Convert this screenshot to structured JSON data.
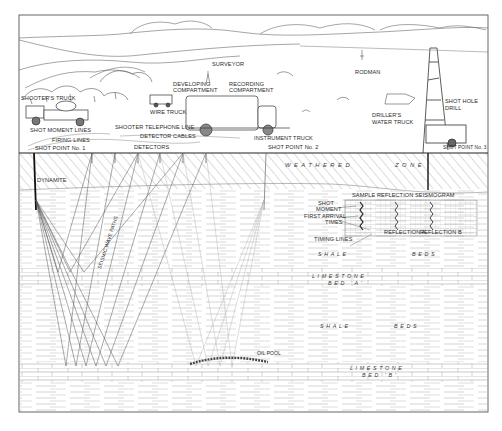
{
  "diagram": {
    "surface_labels": {
      "surveyor": "SURVEYOR",
      "rodman": "RODMAN",
      "developing_compartment": [
        "DEVELOPING",
        "COMPARTMENT"
      ],
      "recording_compartment": [
        "RECORDING",
        "COMPARTMENT"
      ],
      "shooters_truck": "SHOOTER'S TRUCK",
      "wire_truck": "WIRE TRUCK",
      "shot_moment_lines": "SHOT MOMENT LINES",
      "firing_lines": "FIRING LINES",
      "shooter": "SHOOTER",
      "telephone_line": "TELEPHONE LINE",
      "detector_cables": "DETECTOR CABLES",
      "instrument_truck": "INSTRUMENT TRUCK",
      "drillers_water_truck": [
        "DRILLER'S",
        "WATER TRUCK"
      ],
      "shot_hole_drill": [
        "SHOT HOLE",
        "DRILL"
      ],
      "detectors": "DETECTORS",
      "shot_point_1": "SHOT POINT No. 1",
      "shot_point_2": "SHOT POINT No. 2",
      "shot_point_3": "SHOT POINT No. 3"
    },
    "subsurface_labels": {
      "dynamite": "DYNAMITE",
      "weathered": "WEATHERED",
      "zone": "ZONE",
      "seismic_wave_paths": "SEISMIC WAVE PATHS",
      "shale_1": "SHALE",
      "beds_1": "BEDS",
      "limestone_a": "LIMESTONE",
      "bed_a": "BED 'A'",
      "shale_2": "SHALE",
      "beds_2": "BEDS",
      "limestone_b": "LIMESTONE",
      "bed_b": "BED 'B'",
      "oil_pool": "OIL POOL"
    },
    "seismogram": {
      "title": "SAMPLE REFLECTION SEISMOGRAM",
      "shot_moment": [
        "SHOT",
        "MOMENT"
      ],
      "first_arrival_times": [
        "FIRST ARRIVAL",
        "TIMES"
      ],
      "timing_lines": "TIMING LINES",
      "reflection_a": "REFLECTION A",
      "reflection_b": "REFLECTION B"
    },
    "colors": {
      "ink": "#2a2a2a",
      "light_ink": "#8a8a8a",
      "paper": "#ffffff"
    }
  }
}
